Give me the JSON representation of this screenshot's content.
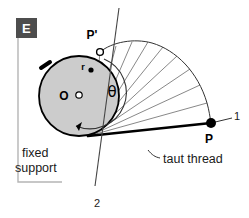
{
  "figure": {
    "panel_label": "E",
    "title_text": "",
    "background_color": "#ffffff",
    "disk_fill_color": "#cccccc",
    "stroke_color": "#000000",
    "panel_box_color": "#4d4d4d",
    "support_line_color": "#b3b3b3",
    "thin_line_color": "#555555"
  },
  "labels": {
    "center": "O",
    "radius": "r",
    "angle": "θ",
    "point_p_prime": "P'",
    "point_p": "P",
    "position_one": "1",
    "position_two": "2",
    "fixed_support_line1": "fixed",
    "fixed_support_line2": "support",
    "taut_thread": "taut thread"
  },
  "geometry": {
    "disk_center_x": 79,
    "disk_center_y": 96,
    "disk_radius": 40,
    "point_p_x": 211,
    "point_p_y": 123,
    "point_p_prime_x": 100,
    "point_p_prime_y": 52,
    "tangent_point_x": 92,
    "tangent_point_y": 135
  }
}
